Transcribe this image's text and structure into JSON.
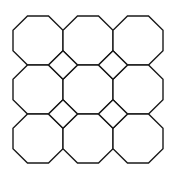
{
  "diagram": {
    "type": "truncated-square-tiling",
    "rows": 3,
    "cols": 3,
    "origin": [
      13,
      16
    ],
    "cell_width": 50,
    "cell_height": 49,
    "corner_cut": 14.5,
    "stroke_color": "#1a1a1a",
    "fill_color": "#ffffff",
    "background": "#ffffff",
    "octagon_count": 9,
    "square_count": 4
  }
}
